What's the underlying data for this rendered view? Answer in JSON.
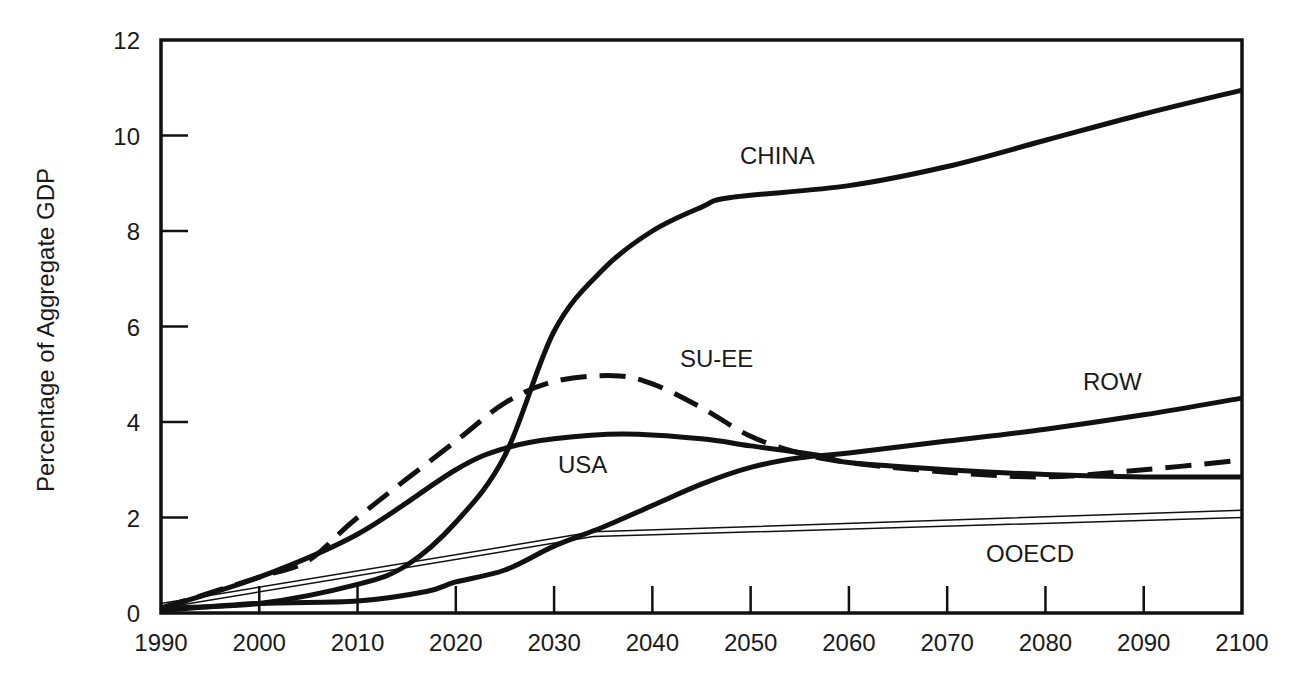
{
  "chart_data": {
    "type": "line",
    "title": "",
    "xlabel": "",
    "ylabel": "Percentage of Aggregate GDP",
    "xlim": [
      1990,
      2100
    ],
    "ylim": [
      0,
      12
    ],
    "grid": false,
    "legend": "inline labels",
    "x_ticks": [
      1990,
      2000,
      2010,
      2020,
      2030,
      2040,
      2050,
      2060,
      2070,
      2080,
      2090,
      2100
    ],
    "y_ticks": [
      0,
      2,
      4,
      6,
      8,
      10,
      12
    ],
    "series": [
      {
        "name": "CHINA",
        "style": "solid-thick",
        "x": [
          1990,
          2000,
          2010,
          2015,
          2020,
          2025,
          2030,
          2035,
          2040,
          2045,
          2048,
          2060,
          2070,
          2080,
          2090,
          2100
        ],
        "values": [
          0.1,
          0.2,
          0.6,
          1.0,
          1.9,
          3.3,
          5.9,
          7.2,
          8.0,
          8.5,
          8.7,
          8.95,
          9.35,
          9.9,
          10.45,
          10.95
        ],
        "label_pos": [
          2038,
          9.5
        ]
      },
      {
        "name": "SU-EE",
        "style": "dashed-thick",
        "x": [
          1990,
          2000,
          2005,
          2010,
          2020,
          2025,
          2030,
          2036,
          2040,
          2045,
          2050,
          2055,
          2060,
          2070,
          2080,
          2090,
          2100
        ],
        "values": [
          0.1,
          0.75,
          1.1,
          2.0,
          3.6,
          4.4,
          4.85,
          4.97,
          4.8,
          4.3,
          3.7,
          3.35,
          3.15,
          2.95,
          2.85,
          3.0,
          3.2
        ],
        "label_pos": [
          2032,
          5.1
        ]
      },
      {
        "name": "USA",
        "style": "solid-thick",
        "x": [
          1990,
          2000,
          2010,
          2020,
          2025,
          2030,
          2037,
          2045,
          2050,
          2057,
          2060,
          2070,
          2080,
          2090,
          2100
        ],
        "values": [
          0.1,
          0.75,
          1.65,
          3.0,
          3.45,
          3.65,
          3.75,
          3.65,
          3.5,
          3.3,
          3.15,
          3.0,
          2.9,
          2.85,
          2.85
        ],
        "label_pos": [
          2020,
          2.9
        ]
      },
      {
        "name": "ROW",
        "style": "solid-thick",
        "x": [
          1990,
          2000,
          2010,
          2017,
          2020,
          2025,
          2030,
          2035,
          2040,
          2045,
          2050,
          2055,
          2060,
          2070,
          2080,
          2090,
          2100
        ],
        "values": [
          0.05,
          0.2,
          0.25,
          0.45,
          0.65,
          0.9,
          1.4,
          1.8,
          2.25,
          2.7,
          3.05,
          3.25,
          3.35,
          3.6,
          3.85,
          4.15,
          4.5
        ],
        "label_pos": [
          2083,
          4.5
        ]
      },
      {
        "name": "OOECD",
        "style": "double-thin",
        "x": [
          1990,
          2034,
          2100
        ],
        "values": [
          0.2,
          1.7,
          2.15
        ],
        "values_lower": [
          0.1,
          1.6,
          2.0
        ],
        "label_pos": [
          2067,
          1.2
        ]
      }
    ]
  },
  "axes": {
    "y_label": "Percentage of Aggregate GDP",
    "x_tick_labels": [
      "1990",
      "2000",
      "2010",
      "2020",
      "2030",
      "2040",
      "2050",
      "2060",
      "2070",
      "2080",
      "2090",
      "2100"
    ],
    "y_tick_labels": [
      "0",
      "2",
      "4",
      "6",
      "8",
      "10",
      "12"
    ]
  },
  "labels": {
    "china": "CHINA",
    "su_ee": "SU-EE",
    "usa": "USA",
    "row": "ROW",
    "ooecd": "OOECD"
  },
  "colors": {
    "ink": "#111111",
    "background": "#ffffff"
  }
}
